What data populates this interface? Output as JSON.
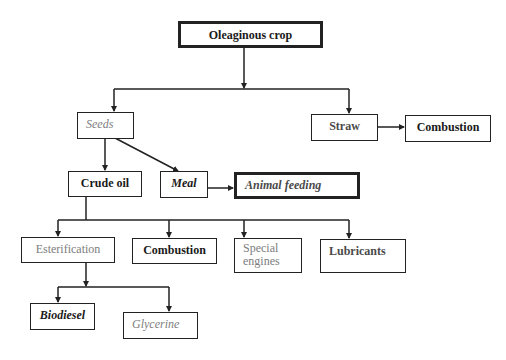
{
  "diagram": {
    "type": "flowchart",
    "nodes": {
      "oleaginous_crop": "Oleaginous crop",
      "seeds": "Seeds",
      "straw": "Straw",
      "straw_combustion": "Combustion",
      "crude_oil": "Crude oil",
      "meal": "Meal",
      "animal_feeding": "Animal feeding",
      "esterification": "Esterification",
      "oil_combustion": "Combustion",
      "special_engines": "Special engines",
      "lubricants": "Lubricants",
      "biodiesel": "Biodiesel",
      "glycerine": "Glycerine"
    },
    "edges": [
      {
        "from": "Oleaginous crop",
        "to": "Seeds"
      },
      {
        "from": "Oleaginous crop",
        "to": "Straw"
      },
      {
        "from": "Straw",
        "to": "Combustion"
      },
      {
        "from": "Seeds",
        "to": "Crude oil"
      },
      {
        "from": "Seeds",
        "to": "Meal"
      },
      {
        "from": "Meal",
        "to": "Animal feeding"
      },
      {
        "from": "Crude oil",
        "to": "Esterification"
      },
      {
        "from": "Crude oil",
        "to": "Combustion"
      },
      {
        "from": "Crude oil",
        "to": "Special engines"
      },
      {
        "from": "Crude oil",
        "to": "Lubricants"
      },
      {
        "from": "Esterification",
        "to": "Biodiesel"
      },
      {
        "from": "Esterification",
        "to": "Glycerine"
      }
    ],
    "colors": {
      "line": "#222222",
      "text_dark": "#1a1a1a",
      "text_gray": "#7d7d7d"
    }
  }
}
